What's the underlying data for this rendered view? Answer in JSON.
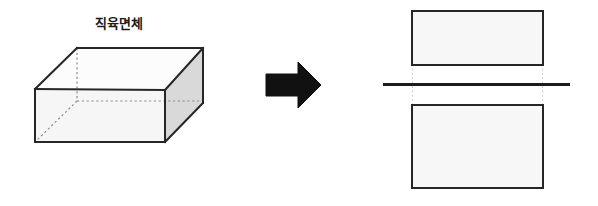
{
  "figure": {
    "title_label": "직육면체",
    "colors": {
      "stroke": "#262626",
      "front_face_fill": "#f6f6f6",
      "top_face_fill": "#fcfcfc",
      "side_face_fill": "#d9d9d9",
      "hidden_edge": "#8c8c8c",
      "arrow_fill": "#111111",
      "rect_fill": "#f7f7f7",
      "divider_line": "#1c1c1c",
      "guide_line": "#cfcfcf",
      "background": "#ffffff"
    },
    "left_panel": {
      "name": "rectangular-cuboid",
      "label": "직육면체",
      "faces": [
        {
          "name": "top-face",
          "points": "35,89 77,48 203,48 165,90"
        },
        {
          "name": "front-face",
          "points": "35,89 165,90 165,142 35,142"
        },
        {
          "name": "right-face",
          "points": "165,90 203,48 203,103 165,142"
        }
      ],
      "visible_edges": [
        {
          "name": "top-back-edge",
          "x1": 77,
          "y1": 48,
          "x2": 203,
          "y2": 48
        },
        {
          "name": "top-left-edge",
          "x1": 35,
          "y1": 89,
          "x2": 77,
          "y2": 48
        },
        {
          "name": "top-front-edge",
          "x1": 35,
          "y1": 89,
          "x2": 165,
          "y2": 90
        },
        {
          "name": "top-right-edge",
          "x1": 165,
          "y1": 90,
          "x2": 203,
          "y2": 48
        },
        {
          "name": "front-left-edge",
          "x1": 35,
          "y1": 89,
          "x2": 35,
          "y2": 142
        },
        {
          "name": "front-bottom-edge",
          "x1": 35,
          "y1": 142,
          "x2": 165,
          "y2": 142
        },
        {
          "name": "front-right-edge",
          "x1": 165,
          "y1": 90,
          "x2": 165,
          "y2": 142
        },
        {
          "name": "back-right-edge",
          "x1": 203,
          "y1": 48,
          "x2": 203,
          "y2": 103
        },
        {
          "name": "bottom-right-edge",
          "x1": 165,
          "y1": 142,
          "x2": 203,
          "y2": 103
        }
      ],
      "hidden_edges": [
        {
          "name": "hidden-vertical-edge",
          "x1": 77,
          "y1": 48,
          "x2": 77,
          "y2": 101
        },
        {
          "name": "hidden-back-bottom-edge",
          "x1": 77,
          "y1": 101,
          "x2": 203,
          "y2": 101
        },
        {
          "name": "hidden-diagonal-edge",
          "x1": 77,
          "y1": 101,
          "x2": 35,
          "y2": 142
        }
      ]
    },
    "arrow": {
      "name": "right-arrow",
      "points": "266,74 298,74 298,62 321,85 298,108 298,96 266,96"
    },
    "right_panel": {
      "rectangles": [
        {
          "name": "top-rectangle",
          "x": 412,
          "y": 11,
          "width": 131,
          "height": 54
        },
        {
          "name": "bottom-rectangle",
          "x": 412,
          "y": 105,
          "width": 131,
          "height": 83
        }
      ],
      "divider": {
        "name": "cutting-plane-line",
        "x1": 383,
        "y1": 84,
        "x2": 570,
        "y2": 84
      },
      "guides": [
        {
          "name": "left-guide-line",
          "x": 412,
          "y1": 65,
          "y2": 105
        },
        {
          "name": "right-guide-line",
          "x": 543,
          "y1": 65,
          "y2": 105
        }
      ]
    }
  }
}
